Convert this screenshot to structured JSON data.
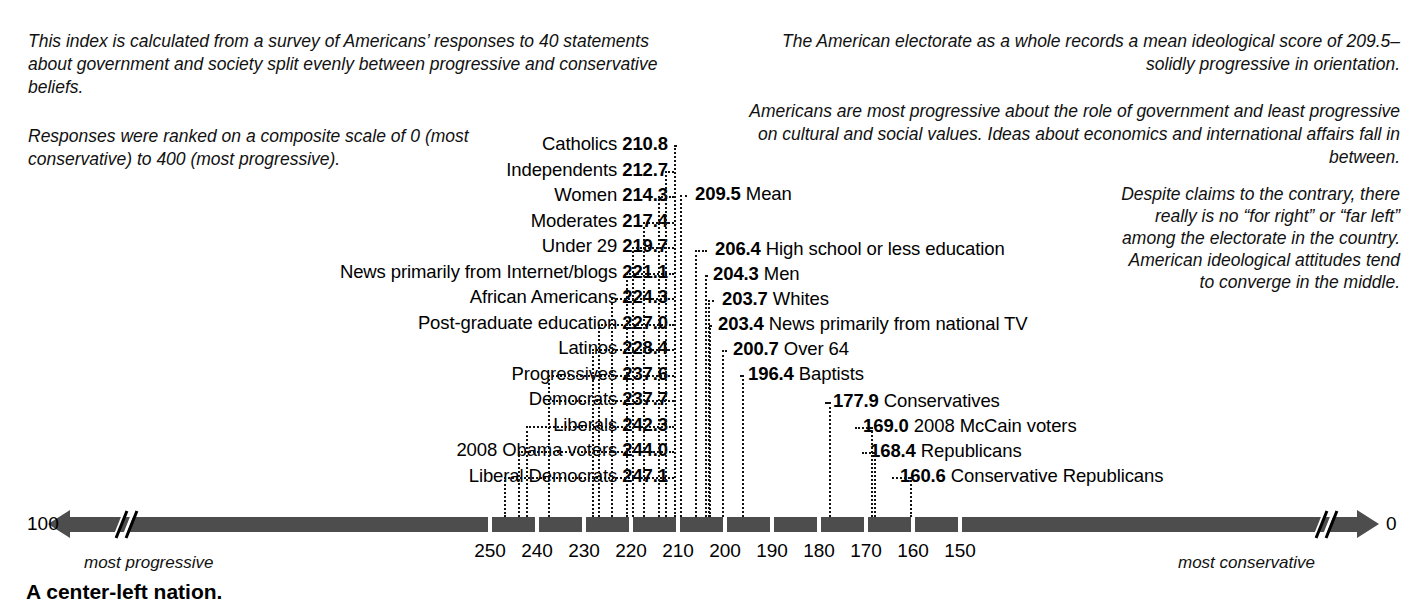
{
  "title": "A center-left nation.",
  "notes": {
    "intro": "This index is calculated from a survey of Americans’ responses to 40 statements about government and society split evenly between progressive and conservative beliefs.",
    "scale": "Responses were ranked on a composite scale of 0 (most conservative) to 400 (most progressive).",
    "mean": "The American electorate as a whole records a mean ideological score of 209.5–solidly progressive in orientation.",
    "issues": "Americans are most progressive about the role of government and least progressive on cultural and social values. Ideas about economics and international affairs fall in between.",
    "converge": "Despite claims to the contrary, there really is no “for right” or “far left” among the electorate in the country. American ideological attitudes tend to converge in the middle."
  },
  "axis": {
    "left_value": "100",
    "right_value": "0",
    "left_caption": "most progressive",
    "right_caption": "most conservative",
    "ticks": [
      "250",
      "240",
      "230",
      "220",
      "210",
      "200",
      "190",
      "180",
      "170",
      "160",
      "150"
    ],
    "tick_values": [
      250,
      240,
      230,
      220,
      210,
      200,
      190,
      180,
      170,
      160,
      150
    ],
    "bar_color": "#4d4d4d",
    "break_marks": true
  },
  "chart_data": {
    "type": "scatter",
    "title": "A center-left nation.",
    "xlabel": "Ideological score (composite scale 0 = most conservative, 400 = most progressive)",
    "ylabel": "",
    "xlim": [
      100,
      0
    ],
    "axis_direction": "reversed (100 at left, 0 at right)",
    "grid": false,
    "legend": "none",
    "mean": 209.5,
    "categories": [
      "Liberal Democrats",
      "2008 Obama voters",
      "Liberals",
      "Democrats",
      "Progressives",
      "Latinos",
      "Post-graduate education",
      "African Americans",
      "News primarily from Internet/blogs",
      "Under 29",
      "Moderates",
      "Women",
      "Independents",
      "Catholics",
      "Mean",
      "High school or less education",
      "Men",
      "Whites",
      "News primarily from national TV",
      "Over 64",
      "Baptists",
      "Conservatives",
      "2008 McCain voters",
      "Republicans",
      "Conservative Republicans"
    ],
    "values": [
      247.1,
      244.0,
      242.3,
      237.7,
      237.6,
      228.4,
      227.0,
      224.3,
      221.1,
      219.7,
      217.4,
      214.3,
      212.7,
      210.8,
      209.5,
      206.4,
      204.3,
      203.7,
      203.4,
      200.7,
      196.4,
      177.9,
      169.0,
      168.4,
      160.6
    ]
  },
  "rows_left": [
    {
      "name": "Catholics",
      "value": "210.8",
      "v": 210.8
    },
    {
      "name": "Independents",
      "value": "212.7",
      "v": 212.7
    },
    {
      "name": "Women",
      "value": "214.3",
      "v": 214.3
    },
    {
      "name": "Moderates",
      "value": "217.4",
      "v": 217.4
    },
    {
      "name": "Under 29",
      "value": "219.7",
      "v": 219.7
    },
    {
      "name": "News primarily from Internet/blogs",
      "value": "221.1",
      "v": 221.1
    },
    {
      "name": "African Americans",
      "value": "224.3",
      "v": 224.3
    },
    {
      "name": "Post-graduate education",
      "value": "227.0",
      "v": 227.0
    },
    {
      "name": "Latinos",
      "value": "228.4",
      "v": 228.4
    },
    {
      "name": "Progressives",
      "value": "237.6",
      "v": 237.6
    },
    {
      "name": "Democrats",
      "value": "237.7",
      "v": 237.7
    },
    {
      "name": "Liberals",
      "value": "242.3",
      "v": 242.3
    },
    {
      "name": "2008 Obama voters",
      "value": "244.0",
      "v": 244.0
    },
    {
      "name": "Liberal Democrats",
      "value": "247.1",
      "v": 247.1
    }
  ],
  "rows_right": [
    {
      "name": "Mean",
      "value": "209.5",
      "v": 209.5
    },
    {
      "name": "High school or less education",
      "value": "206.4",
      "v": 206.4
    },
    {
      "name": "Men",
      "value": "204.3",
      "v": 204.3
    },
    {
      "name": "Whites",
      "value": "203.7",
      "v": 203.7
    },
    {
      "name": "News primarily from national TV",
      "value": "203.4",
      "v": 203.4
    },
    {
      "name": "Over 64",
      "value": "200.7",
      "v": 200.7
    },
    {
      "name": "Baptists",
      "value": "196.4",
      "v": 196.4
    },
    {
      "name": "Conservatives",
      "value": "177.9",
      "v": 177.9
    },
    {
      "name": "2008 McCain voters",
      "value": "169.0",
      "v": 169.0
    },
    {
      "name": "Republicans",
      "value": "168.4",
      "v": 168.4
    },
    {
      "name": "Conservative Republicans",
      "value": "160.6",
      "v": 160.6
    }
  ]
}
